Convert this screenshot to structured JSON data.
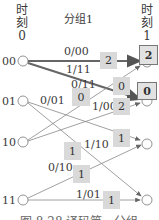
{
  "header": {
    "time0": {
      "chars": [
        "时",
        "刻"
      ],
      "index": "0"
    },
    "time1": {
      "chars": [
        "时",
        "刻"
      ],
      "index": "1"
    },
    "group_label": "分组1"
  },
  "states": [
    "00",
    "01",
    "10",
    "11"
  ],
  "edges": [
    {
      "from": "00",
      "to": "00",
      "label": "0/00",
      "metric": "2",
      "survivor": true
    },
    {
      "from": "00",
      "to": "01",
      "label": "1/11",
      "metric": "0",
      "survivor": true
    },
    {
      "from": "10",
      "to": "00",
      "label": "0/11",
      "metric": "0",
      "survivor": false
    },
    {
      "from": "10",
      "to": "01",
      "label": "1/00",
      "metric": "2",
      "survivor": false
    },
    {
      "from": "01",
      "to": "10",
      "label": "0/01",
      "metric": "1",
      "survivor": false
    },
    {
      "from": "01",
      "to": "11",
      "label": "1/10",
      "metric": "1",
      "survivor": false
    },
    {
      "from": "11",
      "to": "10",
      "label": "0/10",
      "metric": "1",
      "survivor": false
    },
    {
      "from": "11",
      "to": "11",
      "label": "1/01",
      "metric": "1",
      "survivor": false
    }
  ],
  "path_metrics_time1": {
    "00": "2",
    "01": "0"
  },
  "caption": "图 8.28 译码第一分组"
}
